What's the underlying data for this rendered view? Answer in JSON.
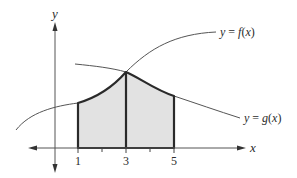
{
  "figure": {
    "axes": {
      "x_label": "x",
      "y_label": "y",
      "x_ticks": [
        {
          "value": 1,
          "label": "1"
        },
        {
          "value": 2,
          "label": ""
        },
        {
          "value": 3,
          "label": "3"
        },
        {
          "value": 4,
          "label": ""
        },
        {
          "value": 5,
          "label": "5"
        }
      ]
    },
    "curves": [
      {
        "name": "f",
        "label": "y = f(x)",
        "label_parts": [
          "y",
          " = ",
          "f",
          "(",
          "x",
          ")"
        ]
      },
      {
        "name": "g",
        "label": "y = g(x)",
        "label_parts": [
          "y",
          " = ",
          "g",
          "(",
          "x",
          ")"
        ]
      }
    ],
    "shaded_region": {
      "x_start": 1,
      "x_split": 3,
      "x_end": 5,
      "upper_left": "f",
      "upper_right": "g",
      "fill_color": "#e2e2e2"
    },
    "colors": {
      "curve": "#555555",
      "region_border": "#2a2a2a",
      "axis": "#555555",
      "fill": "#e2e2e2"
    }
  }
}
